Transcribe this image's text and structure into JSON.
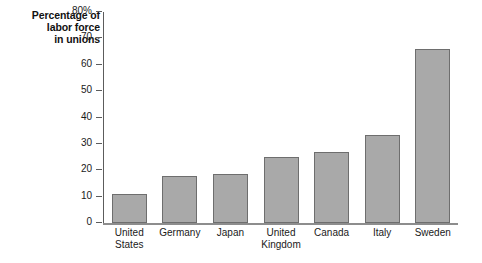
{
  "chart_data": {
    "type": "bar",
    "title": "Percentage of labor force in unions",
    "title_lines": [
      "Percentage of",
      "labor force",
      "in unions"
    ],
    "xlabel": "",
    "ylabel": "Percentage of labor force in unions",
    "categories": [
      "United States",
      "Germany",
      "Japan",
      "United Kingdom",
      "Canada",
      "Italy",
      "Sweden"
    ],
    "category_lines": [
      [
        "United",
        "States"
      ],
      [
        "Germany"
      ],
      [
        "Japan"
      ],
      [
        "United",
        "Kingdom"
      ],
      [
        "Canada"
      ],
      [
        "Italy"
      ],
      [
        "Sweden"
      ]
    ],
    "values": [
      11,
      18,
      18.5,
      25,
      27,
      33.5,
      66
    ],
    "ylim": [
      0,
      80
    ],
    "yticks": [
      0,
      10,
      20,
      30,
      40,
      50,
      60,
      70,
      80
    ],
    "ytick_labels": [
      "0",
      "10",
      "20",
      "30",
      "40",
      "50",
      "60",
      "70",
      "80%"
    ],
    "grid": false,
    "legend": false,
    "bar_color": "#a9a9a9",
    "bar_border_color": "#6e6e6e",
    "axis_color": "#5c5c5c",
    "baseline_color": "#8d8d8d",
    "text_color": "#1a1a1a"
  }
}
